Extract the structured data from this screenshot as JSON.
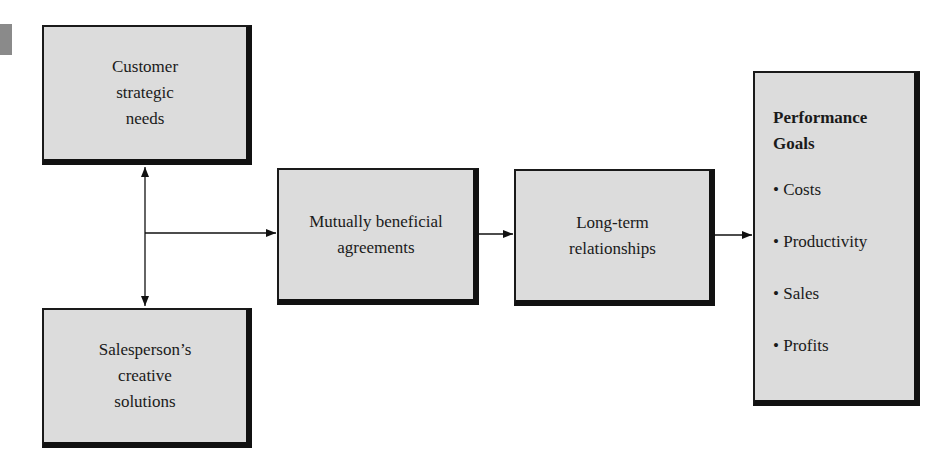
{
  "diagram": {
    "boxes": {
      "customer_needs": [
        "Customer",
        "strategic",
        "needs"
      ],
      "salesperson_solutions": [
        "Salesperson’s",
        "creative",
        "solutions"
      ],
      "mutual_agreements": [
        "Mutually beneficial",
        "agreements"
      ],
      "long_term": [
        "Long-term",
        "relationships"
      ],
      "performance": {
        "title": [
          "Performance",
          "Goals"
        ],
        "items": [
          "• Costs",
          "• Productivity",
          "• Sales",
          "• Profits"
        ]
      }
    },
    "colors": {
      "box_fill": "#dcdcdc",
      "border": "#111111",
      "marker": "#8a8a8a"
    }
  }
}
